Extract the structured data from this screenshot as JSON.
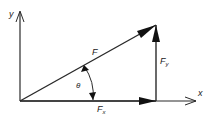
{
  "diagram": {
    "type": "vector-decomposition",
    "axes": {
      "x_label": "x",
      "y_label": "y"
    },
    "vectors": {
      "resultant": {
        "label": "F"
      },
      "x_component": {
        "label": "F",
        "subscript": "x"
      },
      "y_component": {
        "label": "F",
        "subscript": "y"
      }
    },
    "angle": {
      "label": "θ"
    },
    "colors": {
      "stroke": "#2a2a2a",
      "background": "#ffffff"
    }
  }
}
